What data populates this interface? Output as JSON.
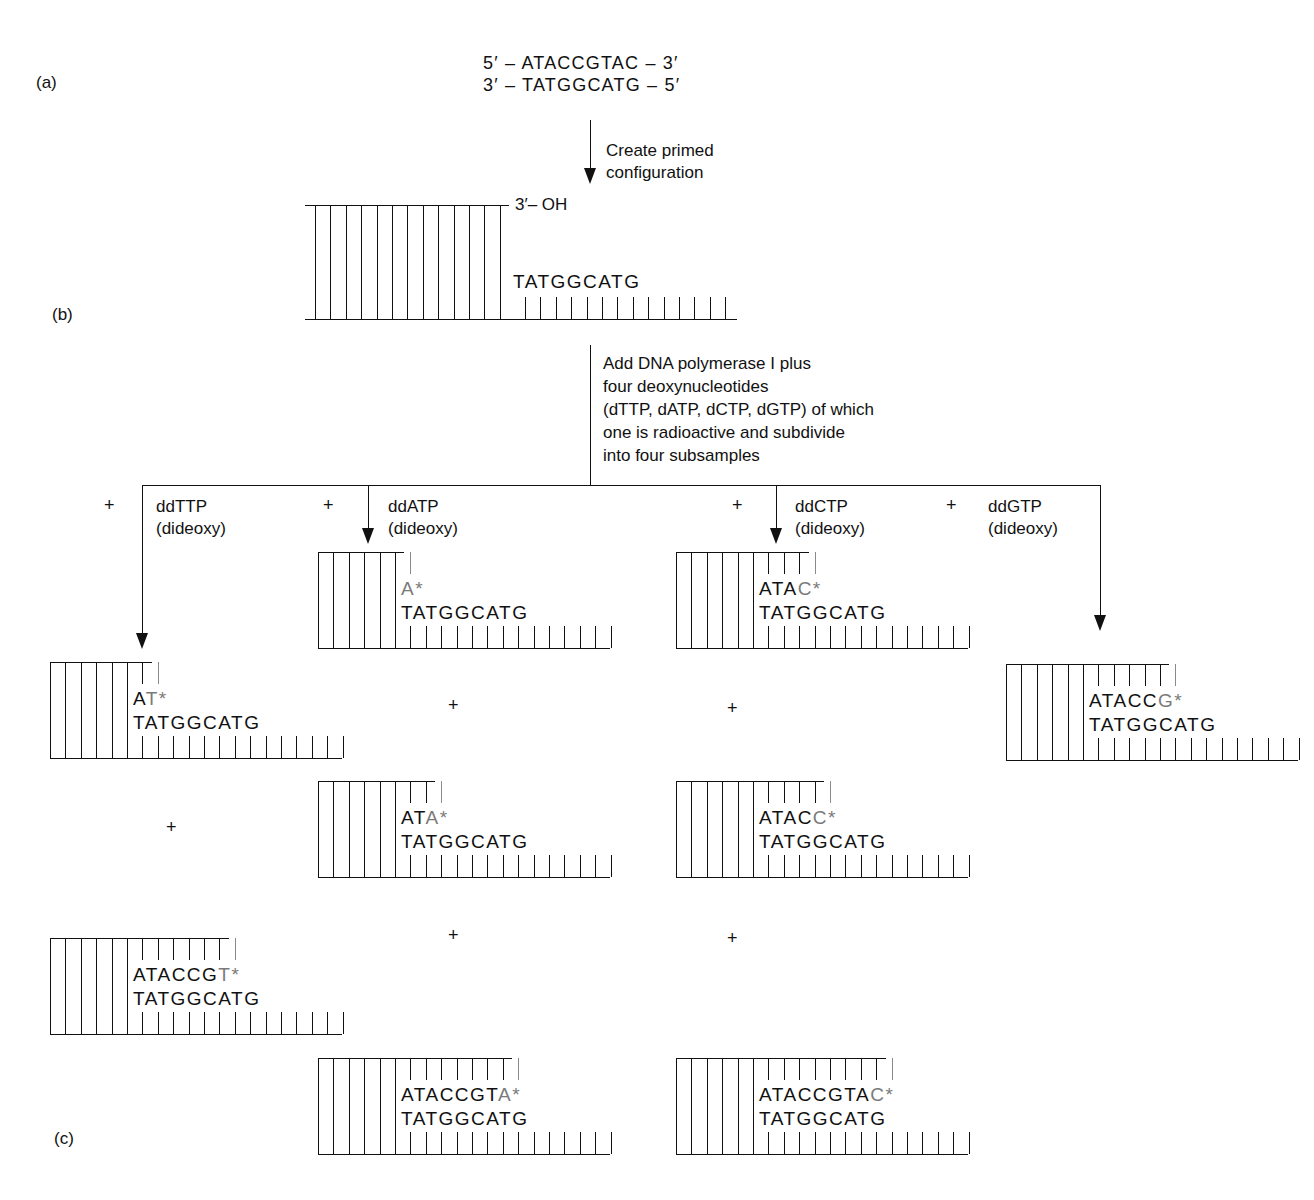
{
  "panel_labels": {
    "a": "(a)",
    "b": "(b)",
    "c": "(c)"
  },
  "duplex": {
    "top_strand": "5′ – ATACCGTAC – 3′",
    "bottom_strand": "3′ – TATGGCATG – 5′"
  },
  "step1": {
    "line1": "Create primed",
    "line2": "configuration"
  },
  "primed": {
    "oh_label": "3′– OH",
    "template": "TATGGCATG",
    "full_bonds": 12,
    "ticks": 14
  },
  "step2": {
    "lines": [
      "Add DNA polymerase I plus",
      "four deoxynucleotides",
      "(dTTP, dATP, dCTP, dGTP) of which",
      "one is radioactive and subdivide",
      "into four subsamples"
    ]
  },
  "branches": [
    {
      "plus": "+",
      "name": "ddTTP",
      "sub": "(dideoxy)"
    },
    {
      "plus": "+",
      "name": "ddATP",
      "sub": "(dideoxy)"
    },
    {
      "plus": "+",
      "name": "ddCTP",
      "sub": "(dideoxy)"
    },
    {
      "plus": "+",
      "name": "ddGTP",
      "sub": "(dideoxy)"
    }
  ],
  "plus_sign": "+",
  "template_seq": "TATGGCATG",
  "fragments": [
    {
      "branch": "ddTTP",
      "x": 50,
      "y": 662,
      "synth": "A",
      "term": "T*"
    },
    {
      "branch": "ddTTP",
      "x": 50,
      "y": 938,
      "synth": "ATACCG",
      "term": "T*"
    },
    {
      "branch": "ddATP",
      "x": 318,
      "y": 552,
      "synth": "",
      "term": "A*"
    },
    {
      "branch": "ddATP",
      "x": 318,
      "y": 781,
      "synth": "AT",
      "term": "A*"
    },
    {
      "branch": "ddATP",
      "x": 318,
      "y": 1058,
      "synth": "ATACCGT",
      "term": "A*"
    },
    {
      "branch": "ddCTP",
      "x": 676,
      "y": 552,
      "synth": "ATA",
      "term": "C*"
    },
    {
      "branch": "ddCTP",
      "x": 676,
      "y": 781,
      "synth": "ATAC",
      "term": "C*"
    },
    {
      "branch": "ddCTP",
      "x": 676,
      "y": 1058,
      "synth": "ATACCGTA",
      "term": "C*"
    },
    {
      "branch": "ddGTP",
      "x": 1006,
      "y": 664,
      "synth": "ATACC",
      "term": "G*"
    }
  ],
  "colors": {
    "ink": "#111111",
    "radioactive": "#7a7a7a"
  }
}
